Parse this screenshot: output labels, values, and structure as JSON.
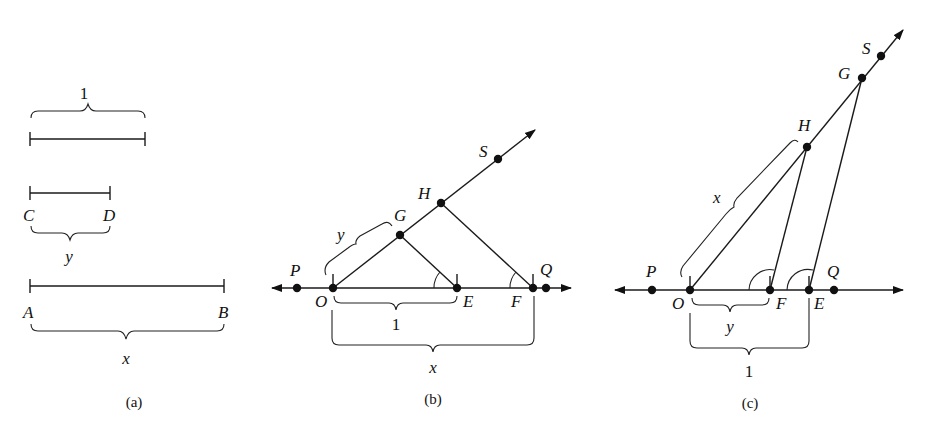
{
  "figure": {
    "panels": [
      {
        "caption": "(a)",
        "segments": [
          {
            "name": "unit",
            "brace_label": "1"
          },
          {
            "name": "CD",
            "endpoints": [
              "C",
              "D"
            ],
            "brace_label": "y"
          },
          {
            "name": "AB",
            "endpoints": [
              "A",
              "B"
            ],
            "brace_label": "x"
          }
        ]
      },
      {
        "caption": "(b)",
        "points": {
          "P": "P",
          "O": "O",
          "E": "E",
          "F": "F",
          "Q": "Q",
          "G": "G",
          "H": "H",
          "S": "S"
        },
        "brace_labels": {
          "OG": "y",
          "OE": "1",
          "OF": "x"
        }
      },
      {
        "caption": "(c)",
        "points": {
          "P": "P",
          "O": "O",
          "F": "F",
          "E": "E",
          "Q": "Q",
          "H": "H",
          "G": "G",
          "S": "S"
        },
        "brace_labels": {
          "OH": "x",
          "OF": "y",
          "OE": "1"
        }
      }
    ]
  }
}
